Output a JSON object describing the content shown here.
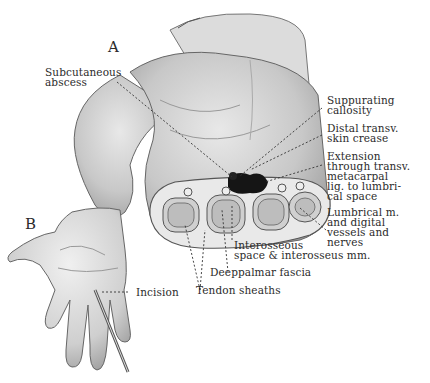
{
  "figure": {
    "panels": [
      {
        "id": "A",
        "letter": "A"
      },
      {
        "id": "B",
        "letter": "B"
      }
    ],
    "labels": {
      "subcutaneous_abscess": "Subcutaneous\nabscess",
      "suppurating_callosity": "Suppurating\ncallosity",
      "distal_transverse_crease": "Distal transv.\nskin crease",
      "extension": "Extension\nthrough transv.\nmetacarpal\nlig. to lumbri-\ncal space",
      "lumbrical": "Lumbrical m.\nand digital\nvessels and\nnerves",
      "interosseous": "Interosseous\nspace & interosseus mm.",
      "deep_palmar_fascia": "Deeppalmar fascia",
      "tendon_sheaths": "Tendon sheaths",
      "incision": "Incision"
    },
    "colors": {
      "ink": "#2b2b2b",
      "skin_light": "#e6e6e6",
      "skin_mid": "#bdbdbd",
      "skin_dark": "#8a8a8a",
      "abscess": "#111111"
    }
  }
}
